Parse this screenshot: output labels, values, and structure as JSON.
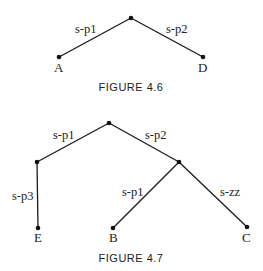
{
  "figures": [
    {
      "caption": "FIGURE 4.6",
      "nodes": [
        {
          "id": "root",
          "label": "",
          "x": 131,
          "y": 18
        },
        {
          "id": "A",
          "label": "A",
          "x": 59,
          "y": 57
        },
        {
          "id": "D",
          "label": "D",
          "x": 203,
          "y": 57
        }
      ],
      "edges": [
        {
          "from": "root",
          "to": "A",
          "label": "s-p1"
        },
        {
          "from": "root",
          "to": "D",
          "label": "s-p2"
        }
      ]
    },
    {
      "caption": "FIGURE 4.7",
      "nodes": [
        {
          "id": "root",
          "label": "",
          "x": 109,
          "y": 123
        },
        {
          "id": "n1",
          "label": "",
          "x": 37,
          "y": 162
        },
        {
          "id": "n2",
          "label": "",
          "x": 179,
          "y": 162
        },
        {
          "id": "E",
          "label": "E",
          "x": 38,
          "y": 228
        },
        {
          "id": "B",
          "label": "B",
          "x": 113,
          "y": 228
        },
        {
          "id": "C",
          "label": "C",
          "x": 247,
          "y": 227
        }
      ],
      "edges": [
        {
          "from": "root",
          "to": "n1",
          "label": "s-p1"
        },
        {
          "from": "root",
          "to": "n2",
          "label": "s-p2"
        },
        {
          "from": "n1",
          "to": "E",
          "label": "s-p3"
        },
        {
          "from": "n2",
          "to": "B",
          "label": "s-p1"
        },
        {
          "from": "n2",
          "to": "C",
          "label": "s-zz"
        }
      ]
    }
  ]
}
